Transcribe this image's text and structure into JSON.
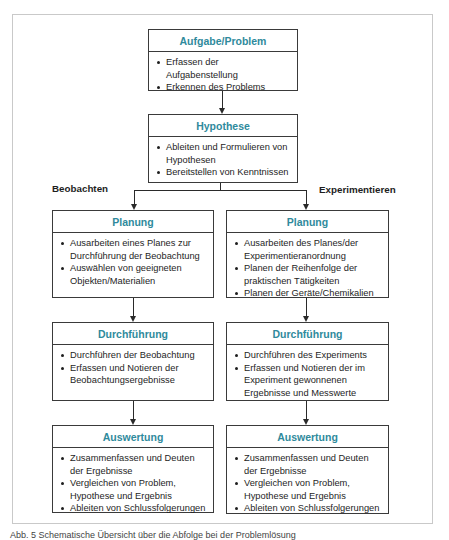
{
  "diagram": {
    "top": {
      "title": "Aufgabe/Problem",
      "items": [
        "Erfassen der Aufgabenstellung",
        "Erkennen des Problems"
      ]
    },
    "hypothesis": {
      "title": "Hypothese",
      "items": [
        "Ableiten und Formulieren von Hypothesen",
        "Bereitstellen von Kenntnissen"
      ]
    },
    "branches": {
      "left_label": "Beobachten",
      "right_label": "Experimentieren"
    },
    "left": {
      "planning": {
        "title": "Planung",
        "items": [
          "Ausarbeiten eines Planes zur Durchführung der Beobachtung",
          "Auswählen von geeigneten Objekten/Materialien"
        ]
      },
      "execution": {
        "title": "Durchführung",
        "items": [
          "Durchführen der Beobachtung",
          "Erfassen und Notieren der Beobachtungsergebnisse"
        ]
      },
      "evaluation": {
        "title": "Auswertung",
        "items": [
          "Zusammenfassen und Deuten der Ergebnisse",
          "Vergleichen von Problem, Hypothese und Ergebnis",
          "Ableiten von Schlussfolgerungen"
        ]
      }
    },
    "right": {
      "planning": {
        "title": "Planung",
        "items": [
          "Ausarbeiten des Planes/der Experimentieranordnung",
          "Planen der Reihenfolge der praktischen Tätigkeiten",
          "Planen der Geräte/Chemikalien"
        ]
      },
      "execution": {
        "title": "Durchführung",
        "items": [
          "Durchführen des Experiments",
          "Erfassen und Notieren der im Experiment gewonnenen Ergebnisse und Messwerte"
        ]
      },
      "evaluation": {
        "title": "Auswertung",
        "items": [
          "Zusammenfassen und Deuten der Ergebnisse",
          "Vergleichen von Problem, Hypothese und Ergebnis",
          "Ableiten von Schlussfolgerungen"
        ]
      }
    }
  },
  "caption": "Abb. 5 Schematische Übersicht über die Abfolge bei der Problemlösung",
  "colors": {
    "title_accent": "#2f8a9c",
    "border": "#3a3a3a",
    "frame": "#c9c9c9"
  }
}
